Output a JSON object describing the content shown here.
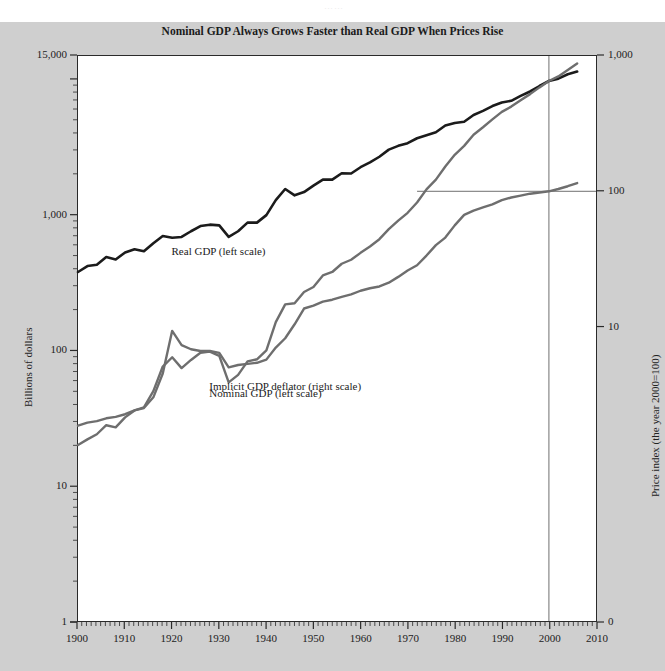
{
  "figure": {
    "ghost_text": "……",
    "background_color": "#cfcfcf",
    "plot_background_color": "#ffffff"
  },
  "chart_data": {
    "type": "line",
    "title": "Nominal GDP Always Grows Faster than Real GDP When Prices Rise",
    "xlabel": "",
    "ylabel": "Billions of dollars",
    "y2label": "Price index (the year 2000=100)",
    "xlim": [
      1900,
      2010
    ],
    "xticks": [
      1900,
      1910,
      1920,
      1930,
      1940,
      1950,
      1960,
      1970,
      1980,
      1990,
      2000,
      2010
    ],
    "xtick_labels": [
      "1900",
      "1910",
      "1920",
      "1930",
      "1940",
      "1950",
      "1960",
      "1970",
      "1980",
      "1990",
      "2000",
      "2010"
    ],
    "x_minor_tick_interval": 1,
    "yscale": "log",
    "ylim": [
      1,
      15000
    ],
    "yticks": [
      1,
      10,
      100,
      1000,
      15000
    ],
    "ytick_labels": [
      "1",
      "10",
      "100",
      "1,000",
      "15,000"
    ],
    "y2scale": "log",
    "y2lim": [
      0.1,
      1000
    ],
    "y2ticks": [
      10,
      100,
      1000
    ],
    "y2tick_labels": [
      "10",
      "100",
      "1,000"
    ],
    "y2_zero_label": "0",
    "grid": false,
    "legend_position": "inline-annotations",
    "annotations": [
      {
        "text": "Real GDP (left scale)",
        "x": 1920,
        "y": 520,
        "axis": "left"
      },
      {
        "text": "Nominal GDP (left scale)",
        "x": 1928,
        "y": 47,
        "axis": "left"
      },
      {
        "text": "Implicit GDP deflator (right scale)",
        "x": 1928,
        "y": 3.5,
        "axis": "right"
      }
    ],
    "reference_lines": [
      {
        "orientation": "vertical",
        "value": 2000,
        "label": "year 2000"
      },
      {
        "orientation": "horizontal",
        "value": 100,
        "axis": "right",
        "label": "price index = 100",
        "x_start": 1972,
        "x_end": 2010
      }
    ],
    "series": [
      {
        "name": "Real GDP (left scale)",
        "axis": "left",
        "units": "Billions of dollars",
        "color": "#1b1b1b",
        "linewidth": 2.6,
        "x": [
          1900,
          1902,
          1904,
          1906,
          1908,
          1910,
          1912,
          1914,
          1916,
          1918,
          1920,
          1922,
          1924,
          1926,
          1928,
          1930,
          1932,
          1934,
          1936,
          1938,
          1940,
          1942,
          1944,
          1946,
          1948,
          1950,
          1952,
          1954,
          1956,
          1958,
          1960,
          1962,
          1964,
          1966,
          1968,
          1970,
          1972,
          1974,
          1976,
          1978,
          1980,
          1982,
          1984,
          1986,
          1988,
          1990,
          1992,
          1994,
          1996,
          1998,
          2000,
          2002,
          2004,
          2006
        ],
        "y": [
          380,
          420,
          430,
          490,
          470,
          530,
          560,
          540,
          620,
          700,
          680,
          690,
          760,
          830,
          850,
          840,
          690,
          760,
          880,
          880,
          1000,
          1290,
          1560,
          1400,
          1480,
          1650,
          1830,
          1830,
          2040,
          2030,
          2260,
          2450,
          2700,
          3050,
          3250,
          3400,
          3700,
          3900,
          4100,
          4600,
          4800,
          4900,
          5500,
          5900,
          6400,
          6800,
          7000,
          7600,
          8200,
          9000,
          9800,
          10200,
          11000,
          11500
        ]
      },
      {
        "name": "Nominal GDP (left scale)",
        "axis": "left",
        "units": "Billions of dollars",
        "color": "#6e6e6e",
        "linewidth": 2.4,
        "x": [
          1900,
          1902,
          1904,
          1906,
          1908,
          1910,
          1912,
          1914,
          1916,
          1918,
          1920,
          1922,
          1924,
          1926,
          1928,
          1930,
          1932,
          1934,
          1936,
          1938,
          1940,
          1942,
          1944,
          1946,
          1948,
          1950,
          1952,
          1954,
          1956,
          1958,
          1960,
          1962,
          1964,
          1966,
          1968,
          1970,
          1972,
          1974,
          1976,
          1978,
          1980,
          1982,
          1984,
          1986,
          1988,
          1990,
          1992,
          1994,
          1996,
          1998,
          2000,
          2002,
          2004,
          2006
        ],
        "y": [
          20,
          22,
          24,
          28,
          27,
          32,
          36,
          38,
          50,
          76,
          89,
          74,
          85,
          96,
          98,
          91,
          58,
          66,
          83,
          86,
          100,
          162,
          219,
          223,
          270,
          294,
          358,
          380,
          437,
          468,
          526,
          586,
          664,
          788,
          910,
          1040,
          1240,
          1550,
          1830,
          2290,
          2790,
          3250,
          3930,
          4460,
          5100,
          5800,
          6340,
          7070,
          7840,
          8790,
          9800,
          10600,
          11800,
          13200
        ]
      },
      {
        "name": "Implicit GDP deflator (right scale)",
        "axis": "right",
        "units": "Price index (the year 2000=100)",
        "color": "#6e6e6e",
        "linewidth": 2.4,
        "x": [
          1900,
          1902,
          1904,
          1906,
          1908,
          1910,
          1912,
          1914,
          1916,
          1918,
          1920,
          1922,
          1924,
          1926,
          1928,
          1930,
          1932,
          1934,
          1936,
          1938,
          1940,
          1942,
          1944,
          1946,
          1948,
          1950,
          1952,
          1954,
          1956,
          1958,
          1960,
          1962,
          1964,
          1966,
          1968,
          1970,
          1972,
          1974,
          1976,
          1978,
          1980,
          1982,
          1984,
          1986,
          1988,
          1990,
          1992,
          1994,
          1996,
          1998,
          2000,
          2002,
          2004,
          2006
        ],
        "y": [
          1.85,
          1.95,
          2.0,
          2.1,
          2.15,
          2.25,
          2.4,
          2.5,
          3.0,
          4.5,
          9.3,
          7.3,
          6.8,
          6.6,
          6.6,
          6.4,
          5.0,
          5.2,
          5.3,
          5.4,
          5.7,
          7.0,
          8.2,
          10.4,
          13.6,
          14.3,
          15.3,
          15.8,
          16.6,
          17.3,
          18.4,
          19.2,
          19.8,
          21.1,
          23.3,
          26.0,
          28.4,
          33.5,
          40.0,
          45.5,
          56.0,
          67.0,
          72.0,
          76.0,
          80.0,
          86.0,
          90.0,
          93.0,
          96.0,
          98.0,
          100.0,
          104.0,
          109.0,
          115.0
        ]
      }
    ]
  }
}
